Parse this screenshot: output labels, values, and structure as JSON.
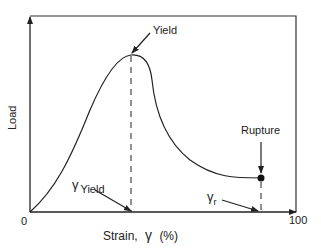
{
  "diagram": {
    "type": "load-strain curve",
    "y_axis_label": "Load",
    "x_axis_label": "Strain,",
    "x_axis_symbol": "γ",
    "x_axis_unit": "(%)",
    "origin_label": "0",
    "x_max_label": "100",
    "annotations": {
      "yield": "Yield",
      "rupture": "Rupture",
      "gamma_yield_symbol": "γ",
      "gamma_yield_sub": "Yield",
      "gamma_r_symbol": "γ",
      "gamma_r_sub": "r"
    },
    "colors": {
      "ink": "#222222",
      "background": "#ffffff"
    }
  }
}
